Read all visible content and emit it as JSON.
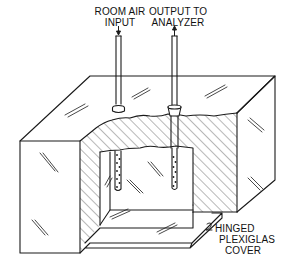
{
  "diagram": {
    "type": "apparatus-cutaway",
    "labels": {
      "room_air_input": [
        "ROOM AIR",
        "INPUT"
      ],
      "output_to_analyzer": [
        "OUTPUT TO",
        "ANALYZER"
      ],
      "hinged_cover": [
        "HINGED",
        "PLEXIGLAS",
        "COVER"
      ]
    },
    "components": [
      {
        "id": "room-air-input-tube",
        "label": "ROOM AIR INPUT",
        "flow": "down"
      },
      {
        "id": "output-to-analyzer-tube",
        "label": "OUTPUT TO ANALYZER",
        "flow": "up"
      },
      {
        "id": "hinged-plexiglas-cover",
        "label": "HINGED PLEXIGLAS COVER"
      }
    ],
    "colors": {
      "line": "#1a1a1a",
      "background": "#ffffff"
    }
  }
}
